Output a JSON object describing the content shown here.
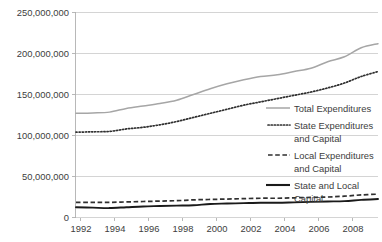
{
  "chart_data": {
    "type": "line",
    "title": "",
    "xlabel": "",
    "ylabel": "",
    "xlim": [
      1992,
      2010
    ],
    "ylim": [
      0,
      250000000
    ],
    "grid": true,
    "legend_position": "right-inside",
    "x": [
      1992,
      1993,
      1994,
      1995,
      1996,
      1997,
      1998,
      1999,
      2000,
      2001,
      2002,
      2003,
      2004,
      2005,
      2006,
      2007,
      2008,
      2009,
      2010
    ],
    "xticks": [
      "1992",
      "1994",
      "1996",
      "1998",
      "2000",
      "2002",
      "2004",
      "2006",
      "2008"
    ],
    "yticks": [
      "0",
      "50,000,000",
      "100,000,000",
      "150,000,000",
      "200,000,000",
      "250,000,000"
    ],
    "ytick_values": [
      0,
      50000000,
      100000000,
      150000000,
      200000000,
      250000000
    ],
    "series": [
      {
        "name": "Total Expenditures",
        "style": "solid-light",
        "color": "#a6a6a6",
        "values": [
          127000000,
          127500000,
          128500000,
          133000000,
          136000000,
          139000000,
          143000000,
          150000000,
          157000000,
          163000000,
          168000000,
          172000000,
          174000000,
          178000000,
          182000000,
          190000000,
          196000000,
          207000000,
          212000000
        ]
      },
      {
        "name": "State Expenditures and Capital",
        "style": "dotted",
        "color": "#2f2f2f",
        "values": [
          104000000,
          104500000,
          105000000,
          108000000,
          110000000,
          113000000,
          117000000,
          122000000,
          127000000,
          132000000,
          137000000,
          141000000,
          145000000,
          149000000,
          153000000,
          158000000,
          164000000,
          172000000,
          178000000
        ]
      },
      {
        "name": "Local Expenditures and Capital",
        "style": "dashed",
        "color": "#2f2f2f",
        "values": [
          18500000,
          18500000,
          18500000,
          19000000,
          19500000,
          20000000,
          20500000,
          21500000,
          22000000,
          22500000,
          23000000,
          23500000,
          23500000,
          24000000,
          24500000,
          25000000,
          26000000,
          27500000,
          28500000
        ]
      },
      {
        "name": "State and Local Capital",
        "style": "solid-bold",
        "color": "#1a1a1a",
        "values": [
          12500000,
          12000000,
          11500000,
          12500000,
          13500000,
          14000000,
          14500000,
          15000000,
          16500000,
          17000000,
          17500000,
          18000000,
          18000000,
          18500000,
          19000000,
          19500000,
          20000000,
          21500000,
          22500000
        ]
      }
    ],
    "legend": [
      {
        "label_line1": "Total Expenditures",
        "label_line2": ""
      },
      {
        "label_line1": "State Expenditures",
        "label_line2": "and Capital"
      },
      {
        "label_line1": "Local Expenditures",
        "label_line2": "and Capital"
      },
      {
        "label_line1": "State and Local",
        "label_line2": "Capital"
      }
    ]
  }
}
